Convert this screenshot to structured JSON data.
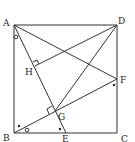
{
  "diagram": {
    "type": "geometry",
    "points": {
      "A": {
        "label": "A",
        "x": 14,
        "y": 25
      },
      "D": {
        "label": "D",
        "x": 117,
        "y": 25
      },
      "B": {
        "label": "B",
        "x": 14,
        "y": 133
      },
      "C": {
        "label": "C",
        "x": 117,
        "y": 133
      },
      "E": {
        "label": "E",
        "x": 66,
        "y": 133
      },
      "F": {
        "label": "F",
        "x": 117,
        "y": 79
      },
      "G": {
        "label": "G",
        "x": 55,
        "y": 111
      },
      "H": {
        "label": "H",
        "x": 35,
        "y": 66
      }
    },
    "segments": [
      "AB",
      "BC",
      "CD",
      "DA",
      "AE",
      "AF",
      "BF",
      "DG",
      "DH"
    ],
    "right_angles": [
      "H",
      "G"
    ],
    "angle_marks": [
      "circle at A (between AB and AE)",
      "circle at B (between BC and BF)",
      "dot at B",
      "dot at E",
      "dot at F"
    ],
    "stroke_color": "#333333"
  }
}
